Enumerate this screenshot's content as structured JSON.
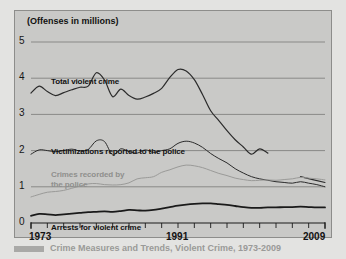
{
  "figure": {
    "background_color": "#c9c9c7",
    "border_color": "#8d8d8b",
    "axis_label_y_title": "(Offenses in millions)"
  },
  "caption": {
    "text": "Crime Measures and Trends, Violent Crime, 1973-2009"
  },
  "chart_data": {
    "type": "line",
    "title": "(Offenses in millions)",
    "xlabel": "",
    "ylabel": "Offenses in millions",
    "xlim": [
      1973,
      2009
    ],
    "ylim": [
      0,
      5
    ],
    "yticks": [
      "0",
      "1",
      "2",
      "3",
      "4",
      "5"
    ],
    "xticks": [
      "1973",
      "1991",
      "2009"
    ],
    "xtick_years_all": [
      1973,
      1975,
      1977,
      1979,
      1981,
      1983,
      1985,
      1987,
      1989,
      1991,
      1993,
      1995,
      1997,
      1999,
      2001,
      2003,
      2005,
      2007,
      2009
    ],
    "grid": true,
    "grid_axis": "y",
    "legend_position": "inline-labels",
    "series": [
      {
        "name": "Total violent crime",
        "color": "#2b2b2b",
        "width": 1.2,
        "label_x": 36,
        "label_y": 66,
        "x": [
          1973,
          1974,
          1975,
          1976,
          1977,
          1978,
          1979,
          1980,
          1981,
          1982,
          1983,
          1984,
          1985,
          1986,
          1987,
          1988,
          1989,
          1990,
          1991,
          1992,
          1993,
          1994,
          1995,
          1996,
          1997,
          1998,
          1999,
          2000,
          2001,
          2002
        ],
        "y": [
          3.59,
          3.78,
          3.63,
          3.52,
          3.6,
          3.68,
          3.75,
          3.78,
          4.15,
          3.95,
          3.49,
          3.7,
          3.52,
          3.42,
          3.48,
          3.58,
          3.72,
          4.02,
          4.24,
          4.2,
          3.96,
          3.55,
          3.1,
          2.83,
          2.55,
          2.3,
          2.1,
          1.9,
          2.05,
          1.93
        ],
        "gap_after_index": 29,
        "tail_segment": {
          "x": [
            2006,
            2009
          ],
          "y": [
            1.28,
            1.12
          ]
        }
      },
      {
        "name": "Victimizations reported to the police",
        "color": "#2b2b2b",
        "width": 1.0,
        "label_x": 36,
        "label_y": 136,
        "x": [
          1973,
          1974,
          1975,
          1976,
          1977,
          1978,
          1979,
          1980,
          1981,
          1982,
          1983,
          1984,
          1985,
          1986,
          1987,
          1988,
          1989,
          1990,
          1991,
          1992,
          1993,
          1994,
          1995,
          1996,
          1997,
          1998,
          1999,
          2000,
          2001,
          2002,
          2003,
          2004,
          2005,
          2006,
          2007,
          2008,
          2009
        ],
        "y": [
          1.9,
          2.02,
          2.0,
          1.97,
          2.0,
          2.04,
          1.99,
          2.03,
          2.27,
          2.25,
          1.88,
          2.05,
          1.97,
          1.93,
          2.02,
          1.95,
          2.0,
          2.05,
          2.2,
          2.26,
          2.21,
          2.09,
          1.92,
          1.78,
          1.66,
          1.5,
          1.38,
          1.28,
          1.22,
          1.18,
          1.14,
          1.12,
          1.1,
          1.14,
          1.1,
          1.06,
          1.0
        ]
      },
      {
        "name": "Crimes recorded by the police",
        "color": "#9a9a98",
        "width": 1.0,
        "label_x": 36,
        "label_y": 159,
        "label_line2_y": 169,
        "x": [
          1973,
          1974,
          1975,
          1976,
          1977,
          1978,
          1979,
          1980,
          1981,
          1982,
          1983,
          1984,
          1985,
          1986,
          1987,
          1988,
          1989,
          1990,
          1991,
          1992,
          1993,
          1994,
          1995,
          1996,
          1997,
          1998,
          1999,
          2000,
          2001,
          2002,
          2003,
          2004,
          2005,
          2006,
          2007,
          2008,
          2009
        ],
        "y": [
          0.72,
          0.79,
          0.85,
          0.87,
          0.9,
          0.96,
          1.02,
          1.08,
          1.09,
          1.06,
          1.05,
          1.06,
          1.11,
          1.22,
          1.25,
          1.28,
          1.4,
          1.47,
          1.55,
          1.6,
          1.58,
          1.53,
          1.45,
          1.37,
          1.31,
          1.24,
          1.2,
          1.17,
          1.18,
          1.19,
          1.18,
          1.2,
          1.22,
          1.26,
          1.24,
          1.22,
          1.19
        ]
      },
      {
        "name": "Arrests for violent crime",
        "color": "#1a1a1a",
        "width": 1.8,
        "label_x": 36,
        "label_y": 212,
        "x": [
          1973,
          1974,
          1975,
          1976,
          1977,
          1978,
          1979,
          1980,
          1981,
          1982,
          1983,
          1984,
          1985,
          1986,
          1987,
          1988,
          1989,
          1990,
          1991,
          1992,
          1993,
          1994,
          1995,
          1996,
          1997,
          1998,
          1999,
          2000,
          2001,
          2002,
          2003,
          2004,
          2005,
          2006,
          2007,
          2008,
          2009
        ],
        "y": [
          0.2,
          0.25,
          0.24,
          0.22,
          0.24,
          0.26,
          0.28,
          0.3,
          0.31,
          0.32,
          0.31,
          0.33,
          0.36,
          0.35,
          0.34,
          0.36,
          0.4,
          0.44,
          0.48,
          0.51,
          0.53,
          0.54,
          0.54,
          0.52,
          0.5,
          0.47,
          0.44,
          0.42,
          0.42,
          0.43,
          0.43,
          0.44,
          0.44,
          0.45,
          0.44,
          0.43,
          0.43
        ]
      }
    ]
  }
}
